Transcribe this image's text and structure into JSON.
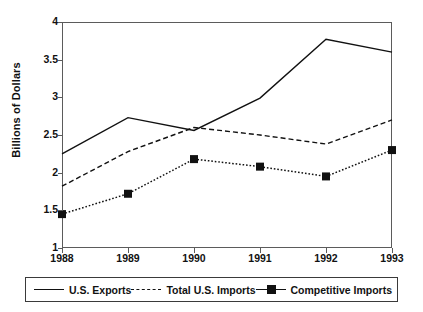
{
  "chart_data": {
    "type": "line",
    "title": "",
    "subtitle": "",
    "xlabel": "",
    "ylabel": "Billions of Dollars",
    "categories": [
      "1988",
      "1989",
      "1990",
      "1991",
      "1992",
      "1993"
    ],
    "x": [
      1988,
      1989,
      1990,
      1991,
      1992,
      1993
    ],
    "xlim": [
      1988,
      1993
    ],
    "ylim": [
      1,
      4
    ],
    "yticks": [
      1,
      1.5,
      2,
      2.5,
      3,
      3.5,
      4
    ],
    "ytick_labels": [
      "1",
      "1.5",
      "2",
      "2.5",
      "3",
      "3.5",
      "4"
    ],
    "grid": false,
    "legend_position": "bottom",
    "series": [
      {
        "name": "U.S. Exports",
        "style": "solid",
        "marker": "none",
        "color": "#111111",
        "values": [
          2.25,
          2.73,
          2.56,
          2.99,
          3.77,
          3.6
        ]
      },
      {
        "name": "Total U.S. Imports",
        "style": "dashed",
        "marker": "none",
        "color": "#111111",
        "values": [
          1.82,
          2.28,
          2.6,
          2.5,
          2.38,
          2.7
        ]
      },
      {
        "name": "Competitive Imports",
        "style": "dotted",
        "marker": "square",
        "color": "#111111",
        "values": [
          1.45,
          1.72,
          2.18,
          2.08,
          1.95,
          2.3
        ]
      }
    ]
  },
  "axes": {
    "y_title": "Billions of Dollars",
    "y_tick_labels": [
      "4",
      "3.5",
      "3",
      "2.5",
      "2",
      "1.5",
      "1"
    ],
    "x_tick_labels": [
      "1988",
      "1989",
      "1990",
      "1991",
      "1992",
      "1993"
    ]
  },
  "legend": {
    "entries": [
      {
        "label": "U.S. Exports",
        "style": "solid",
        "marker": "none"
      },
      {
        "label": "Total U.S. Imports",
        "style": "dashed",
        "marker": "none"
      },
      {
        "label": "Competitive Imports",
        "style": "dotted",
        "marker": "square"
      }
    ]
  }
}
